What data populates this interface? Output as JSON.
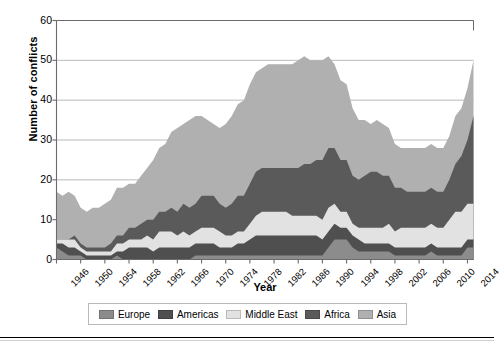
{
  "chart_data": {
    "type": "area",
    "stacked": true,
    "title": "",
    "xlabel": "Year",
    "ylabel": "Number of conflicts",
    "ylim": [
      0,
      60
    ],
    "yticks": [
      0,
      10,
      20,
      30,
      40,
      50,
      60
    ],
    "xlim": [
      1946,
      2015
    ],
    "xticks": [
      1946,
      1950,
      1954,
      1958,
      1962,
      1966,
      1970,
      1974,
      1978,
      1982,
      1986,
      1990,
      1994,
      1998,
      2002,
      2006,
      2010,
      2014
    ],
    "grid": "horizontal",
    "legend_position": "bottom",
    "x": [
      1946,
      1947,
      1948,
      1949,
      1950,
      1951,
      1952,
      1953,
      1954,
      1955,
      1956,
      1957,
      1958,
      1959,
      1960,
      1961,
      1962,
      1963,
      1964,
      1965,
      1966,
      1967,
      1968,
      1969,
      1970,
      1971,
      1972,
      1973,
      1974,
      1975,
      1976,
      1977,
      1978,
      1979,
      1980,
      1981,
      1982,
      1983,
      1984,
      1985,
      1986,
      1987,
      1988,
      1989,
      1990,
      1991,
      1992,
      1993,
      1994,
      1995,
      1996,
      1997,
      1998,
      1999,
      2000,
      2001,
      2002,
      2003,
      2004,
      2005,
      2006,
      2007,
      2008,
      2009,
      2010,
      2011,
      2012,
      2013,
      2014,
      2015
    ],
    "series": [
      {
        "name": "Europe",
        "color": "#8c8c8c",
        "values": [
          3,
          2,
          1,
          1,
          1,
          0,
          0,
          0,
          0,
          0,
          1,
          0,
          0,
          0,
          0,
          0,
          0,
          0,
          0,
          0,
          0,
          0,
          0,
          1,
          1,
          1,
          1,
          1,
          1,
          1,
          1,
          1,
          1,
          1,
          1,
          1,
          1,
          1,
          1,
          1,
          1,
          1,
          1,
          1,
          1,
          3,
          5,
          5,
          5,
          3,
          2,
          2,
          2,
          2,
          2,
          2,
          1,
          1,
          1,
          1,
          1,
          1,
          2,
          1,
          1,
          1,
          1,
          1,
          3,
          3
        ]
      },
      {
        "name": "Americas",
        "color": "#4f4f4f",
        "values": [
          1,
          2,
          2,
          2,
          1,
          1,
          1,
          1,
          1,
          1,
          1,
          2,
          3,
          3,
          3,
          3,
          2,
          3,
          3,
          3,
          3,
          3,
          3,
          3,
          3,
          3,
          3,
          2,
          2,
          2,
          3,
          3,
          4,
          5,
          5,
          5,
          5,
          5,
          5,
          5,
          5,
          5,
          5,
          5,
          4,
          4,
          4,
          3,
          3,
          3,
          3,
          2,
          2,
          2,
          2,
          2,
          2,
          2,
          2,
          2,
          2,
          2,
          2,
          2,
          2,
          2,
          2,
          2,
          2,
          2
        ]
      },
      {
        "name": "Middle East",
        "color": "#e2e2e2",
        "values": [
          1,
          1,
          2,
          2,
          1,
          1,
          1,
          1,
          1,
          1,
          2,
          2,
          2,
          2,
          2,
          3,
          3,
          4,
          4,
          4,
          3,
          4,
          3,
          3,
          4,
          4,
          4,
          4,
          3,
          3,
          3,
          3,
          4,
          5,
          6,
          6,
          6,
          6,
          6,
          5,
          5,
          5,
          5,
          5,
          5,
          6,
          5,
          4,
          4,
          3,
          3,
          4,
          4,
          4,
          4,
          5,
          4,
          5,
          5,
          5,
          5,
          5,
          5,
          5,
          5,
          7,
          9,
          9,
          9,
          9
        ]
      },
      {
        "name": "Africa",
        "color": "#5a5a5a",
        "values": [
          0,
          0,
          0,
          1,
          1,
          1,
          1,
          1,
          1,
          2,
          2,
          2,
          3,
          3,
          4,
          4,
          5,
          5,
          5,
          6,
          6,
          7,
          7,
          7,
          8,
          8,
          8,
          7,
          7,
          8,
          9,
          9,
          10,
          11,
          11,
          11,
          11,
          11,
          11,
          12,
          12,
          13,
          13,
          14,
          15,
          15,
          14,
          13,
          13,
          12,
          12,
          13,
          14,
          14,
          13,
          12,
          11,
          10,
          9,
          9,
          9,
          9,
          9,
          9,
          9,
          10,
          12,
          14,
          16,
          22
        ]
      },
      {
        "name": "Asia",
        "color": "#b0b0b0",
        "values": [
          12,
          11,
          12,
          10,
          9,
          9,
          10,
          10,
          11,
          11,
          12,
          12,
          11,
          11,
          12,
          13,
          15,
          16,
          17,
          19,
          21,
          20,
          22,
          22,
          20,
          19,
          18,
          19,
          21,
          22,
          23,
          24,
          25,
          25,
          25,
          26,
          26,
          26,
          26,
          26,
          27,
          27,
          26,
          25,
          25,
          23,
          21,
          20,
          19,
          17,
          15,
          14,
          12,
          13,
          13,
          12,
          11,
          10,
          11,
          11,
          11,
          11,
          11,
          11,
          11,
          11,
          12,
          12,
          13,
          14
        ]
      }
    ]
  },
  "axis": {
    "y_title": "Number of conflicts",
    "x_title": "Year",
    "y_tick_labels": [
      "0",
      "10",
      "20",
      "30",
      "40",
      "50",
      "60"
    ],
    "x_tick_labels": [
      "1946",
      "1950",
      "1954",
      "1958",
      "1962",
      "1966",
      "1970",
      "1974",
      "1978",
      "1982",
      "1986",
      "1990",
      "1994",
      "1998",
      "2002",
      "2006",
      "2010",
      "2014"
    ]
  },
  "legend": {
    "items": [
      {
        "label": "Europe",
        "color": "#8c8c8c"
      },
      {
        "label": "Americas",
        "color": "#4f4f4f"
      },
      {
        "label": "Middle East",
        "color": "#e2e2e2"
      },
      {
        "label": "Africa",
        "color": "#5a5a5a"
      },
      {
        "label": "Asia",
        "color": "#b0b0b0"
      }
    ]
  },
  "colors": {
    "axis": "#6b6b6b",
    "grid": "#a8a8a8",
    "text": "#000000",
    "background": "#ffffff",
    "rule": "#000000"
  }
}
